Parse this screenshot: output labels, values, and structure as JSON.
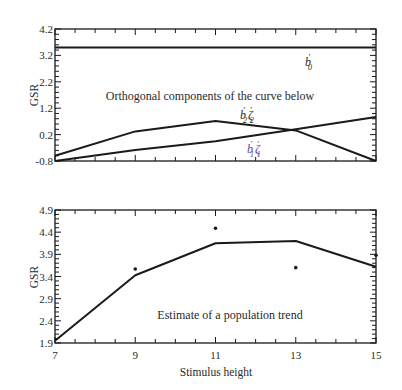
{
  "chart_data": [
    {
      "panel": "top",
      "type": "line",
      "title": "",
      "annotation": "Orthogonal components of the curve below",
      "xlabel": "",
      "ylabel": "GSR",
      "xlim": [
        7,
        15
      ],
      "ylim": [
        -0.8,
        4.2
      ],
      "yticks": [
        "4.2",
        "3.2",
        "2.2",
        "1.2",
        "0.2",
        "-0.8"
      ],
      "ytick_values": [
        4.2,
        3.2,
        2.2,
        1.2,
        0.2,
        -0.8
      ],
      "xtick_values": [
        7,
        9,
        11,
        13,
        15
      ],
      "xtick_labels_visible": false,
      "grid": false,
      "x": [
        7,
        9,
        11,
        13,
        15
      ],
      "series": [
        {
          "name": "b0'",
          "label_display": "b′₀",
          "values": [
            3.5,
            3.5,
            3.5,
            3.5,
            3.5
          ]
        },
        {
          "name": "b1' zeta1'",
          "label_display": "b′₁ζ′₁",
          "values": [
            -0.8,
            -0.38,
            -0.05,
            0.4,
            0.87
          ]
        },
        {
          "name": "b2' zeta2'",
          "label_display": "b′₂ζ′₂",
          "values": [
            -0.6,
            0.32,
            0.72,
            0.36,
            -0.8
          ]
        }
      ]
    },
    {
      "panel": "bottom",
      "type": "line",
      "title": "",
      "annotation": "Estimate of a population trend",
      "xlabel": "Stimulus height",
      "ylabel": "GSR",
      "xlim": [
        7,
        15
      ],
      "ylim": [
        1.9,
        4.9
      ],
      "yticks": [
        "4.9",
        "4.4",
        "3.9",
        "3.4",
        "2.9",
        "2.4",
        "1.9"
      ],
      "ytick_values": [
        4.9,
        4.4,
        3.9,
        3.4,
        2.9,
        2.4,
        1.9
      ],
      "xticks": [
        "7",
        "9",
        "11",
        "13",
        "15"
      ],
      "xtick_values": [
        7,
        9,
        11,
        13,
        15
      ],
      "grid": false,
      "x": [
        7,
        9,
        11,
        13,
        15
      ],
      "series": [
        {
          "name": "estimated trend",
          "kind": "line",
          "values": [
            1.95,
            3.43,
            4.15,
            4.2,
            3.62
          ]
        },
        {
          "name": "observed means",
          "kind": "scatter",
          "values": [
            null,
            3.57,
            4.49,
            3.6,
            3.88
          ]
        }
      ]
    }
  ],
  "labels": {
    "top_annotation": "Orthogonal components of the curve below",
    "bottom_annotation": "Estimate of a population trend",
    "ylabel_top": "GSR",
    "ylabel_bottom": "GSR",
    "xlabel": "Stimulus height",
    "b0": "b",
    "b0_sub": "0",
    "b1": "b",
    "b1_sub": "1",
    "zeta1": "ζ",
    "zeta1_sub": "1",
    "b2": "b",
    "b2_sub": "2",
    "zeta2": "ζ",
    "zeta2_sub": "2",
    "prime": "′"
  }
}
